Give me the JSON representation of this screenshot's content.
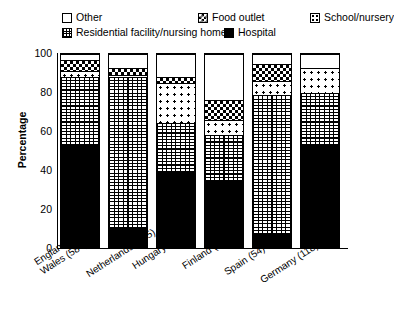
{
  "legend": {
    "rows": [
      [
        {
          "key": "other",
          "label": "Other",
          "pattern": "pat-other"
        },
        {
          "key": "food",
          "label": "Food outlet",
          "pattern": "pat-food"
        },
        {
          "key": "school",
          "label": "School/nursery",
          "pattern": "pat-school"
        }
      ],
      [
        {
          "key": "residential",
          "label": "Residential facility/nursing home",
          "pattern": "pat-resid"
        },
        {
          "key": "hospital",
          "label": "Hospital",
          "pattern": "pat-hospital"
        }
      ]
    ]
  },
  "axes": {
    "ylabel": "Percentage",
    "yticks": [
      "0",
      "20",
      "40",
      "60",
      "80",
      "100"
    ],
    "ymin": 0,
    "ymax": 100
  },
  "chart_data": {
    "type": "bar",
    "stacked": true,
    "title": "",
    "xlabel": "",
    "ylabel": "Percentage",
    "ylim": [
      0,
      100
    ],
    "grid": false,
    "legend_position": "top",
    "categories": [
      "England and\nWales (584)",
      "Netherlands (155)",
      "Hungary (119)",
      "Finland (85)",
      "Spain (54)",
      "Germany (118)"
    ],
    "category_counts": [
      584,
      155,
      119,
      85,
      54,
      118
    ],
    "series": [
      {
        "name": "Hospital",
        "pattern": "pat-hospital",
        "values": [
          53,
          10,
          39,
          34,
          7,
          53
        ]
      },
      {
        "name": "Residential facility/nursing home",
        "pattern": "pat-resid",
        "values": [
          35,
          78,
          25,
          24,
          72,
          27
        ]
      },
      {
        "name": "School/nursery",
        "pattern": "pat-school",
        "values": [
          3,
          1,
          21,
          8,
          7,
          13
        ]
      },
      {
        "name": "Food outlet",
        "pattern": "pat-food",
        "values": [
          6,
          4,
          3,
          10,
          9,
          0
        ]
      },
      {
        "name": "Other",
        "pattern": "pat-other",
        "values": [
          3,
          7,
          12,
          24,
          5,
          7
        ]
      }
    ]
  }
}
